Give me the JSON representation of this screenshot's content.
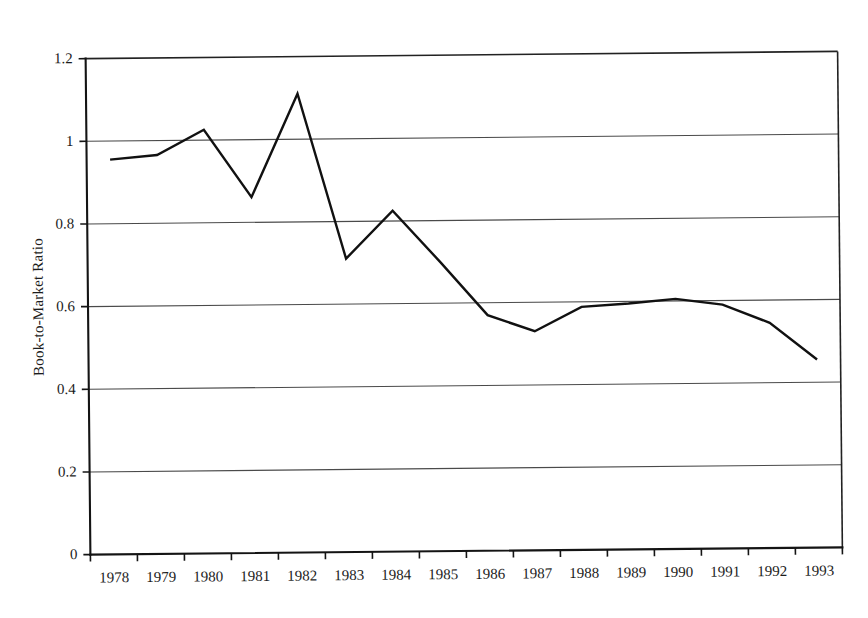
{
  "chart_data": {
    "type": "line",
    "title": "",
    "xlabel": "",
    "ylabel": "Book-to-Market Ratio",
    "categories": [
      "1978",
      "1979",
      "1980",
      "1981",
      "1982",
      "1983",
      "1984",
      "1985",
      "1986",
      "1987",
      "1988",
      "1989",
      "1990",
      "1991",
      "1992",
      "1993"
    ],
    "values": [
      0.955,
      0.965,
      1.025,
      0.861,
      1.11,
      0.71,
      0.825,
      0.7,
      0.57,
      0.53,
      0.588,
      0.595,
      0.605,
      0.59,
      0.545,
      0.455
    ],
    "series": [
      {
        "name": "Book-to-Market Ratio",
        "values": [
          0.955,
          0.965,
          1.025,
          0.861,
          1.11,
          0.71,
          0.825,
          0.7,
          0.57,
          0.53,
          0.588,
          0.595,
          0.605,
          0.59,
          0.545,
          0.455
        ]
      }
    ],
    "ylim": [
      0,
      1.2
    ],
    "y_ticks": [
      "0",
      "0.2",
      "0.4",
      "0.6",
      "0.8",
      "1",
      "1.2"
    ],
    "y_tick_values": [
      0,
      0.2,
      0.4,
      0.6,
      0.8,
      1,
      1.2
    ],
    "grid": true,
    "grid_axis": "y",
    "legend": "none",
    "line_color": "#111111",
    "grid_color": "#4a4a4a",
    "axis_color": "#141414",
    "background_color": "#ffffff"
  }
}
